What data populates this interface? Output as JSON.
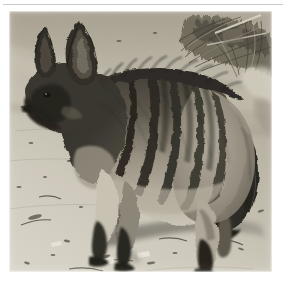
{
  "page": {
    "background_color": "#ffffff",
    "width": 286,
    "height": 282
  },
  "divider": {
    "name": "horizontal-rule",
    "color": "#c9c9c9"
  },
  "figure": {
    "caption": "",
    "frame_color": "#ffffff",
    "image": {
      "type": "photograph",
      "rendering": "black-and-white",
      "subject": "aardwolf",
      "orientation": "facing left, side profile",
      "scene": "arid sandy ground with dry grass and brush in background",
      "lighting": "bright direct sunlight, hard shadow cast to the right",
      "palette": {
        "sand_light": "#d9d4c8",
        "sand_mid": "#bdb5a6",
        "sand_dark": "#8e897c",
        "shadow": "#6b675e",
        "fur_light": "#cac3b4",
        "fur_mid": "#8d8578",
        "fur_dark": "#3b382f",
        "fur_black": "#1b1a16",
        "brush_dark": "#4a463c",
        "brush_light": "#b9b2a2"
      },
      "features": [
        "large upright pointed ears",
        "dark mask on face and muzzle",
        "erect dorsal mane along the back",
        "vertical dark stripes on flank and hindquarters",
        "bushy dark-tipped tail hanging down",
        "black lower legs and feet",
        "pale cream underbelly and chest"
      ]
    }
  }
}
